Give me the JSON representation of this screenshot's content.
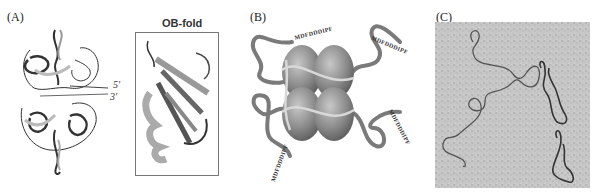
{
  "figure": {
    "panels": [
      {
        "label": "(A)",
        "description": "Ribbon structure of SSB tetramer bound to ssDNA",
        "ends": [
          "5'",
          "3'"
        ],
        "inset": {
          "title": "OB-fold"
        }
      },
      {
        "label": "(B)",
        "description": "Schematic of SSB tetramer with disordered C-terminal tails",
        "tail_sequences": [
          "MDFDDDIPF",
          "MDFDDDIPF",
          "MDFDDDIPF",
          "MDFDDDIPF"
        ]
      },
      {
        "label": "(C)",
        "description": "Electron micrograph of DNA molecules"
      }
    ],
    "colors": {
      "ribbon_dark": "#333333",
      "ribbon_light": "#bbbbbb",
      "sphere": "#8a8a8a",
      "tail": "#7a7a7a",
      "micrograph_bg": "#c8c8c8",
      "dna_strand": "#555555"
    }
  }
}
